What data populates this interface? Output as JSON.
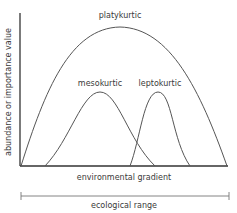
{
  "diagram": {
    "title": "",
    "y_axis_label": "abundance or importance value",
    "x_axis_label": "environmental gradient",
    "range_label": "ecological range",
    "curves": [
      {
        "name": "platykurtic",
        "label": "platykurtic",
        "start_x": 21,
        "peak_x": 120,
        "end_x": 227
      },
      {
        "name": "mesokurtic",
        "label": "mesokurtic",
        "start_x": 45,
        "peak_x": 100,
        "end_x": 155
      },
      {
        "name": "leptokurtic",
        "label": "leptokurtic",
        "start_x": 130,
        "peak_x": 158,
        "end_x": 190
      }
    ],
    "colors": {
      "line": "#555555",
      "axis": "#333333",
      "text": "#3a3a3a",
      "background": "#ffffff"
    }
  }
}
